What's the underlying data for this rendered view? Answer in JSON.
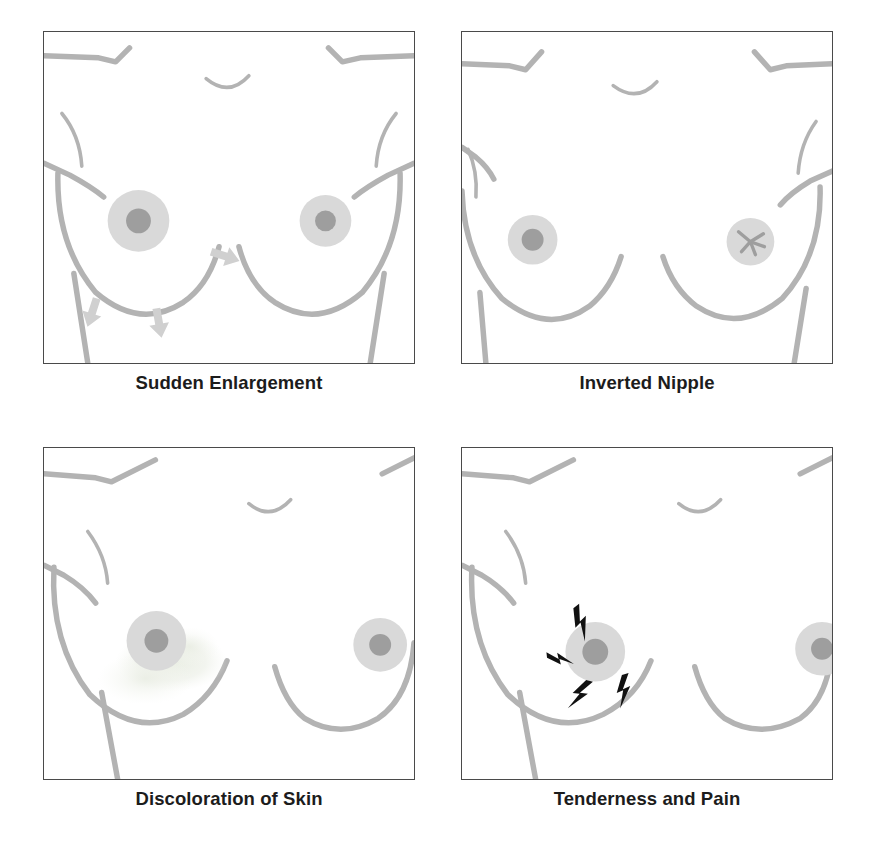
{
  "figure": {
    "layout": "2x2 grid of framed line-art panels with bold captions",
    "background_color": "#ffffff",
    "frame_border_color": "#4a4a4a",
    "body_line_color": "#b3b3b3",
    "areola_color": "#d9d9d9",
    "nipple_color": "#9e9e9e",
    "arrow_color": "#d0d0d0",
    "discoloration_color": "#ecefe6",
    "pain_bolt_color": "#111111",
    "caption_color": "#1c1c1c"
  },
  "panels": [
    {
      "id": "sudden-enlargement",
      "caption": "Sudden Enlargement",
      "marker": "arrows",
      "marker_description": "Light gray arrows pointing outward and downward from the left breast indicating swelling",
      "arrow_count": 3,
      "affected_side": "left"
    },
    {
      "id": "inverted-nipple",
      "caption": "Inverted Nipple",
      "marker": "star-pucker",
      "marker_description": "Right areola shows a puckered asterisk shape instead of a protruding nipple",
      "arrow_count": 0,
      "affected_side": "right"
    },
    {
      "id": "discoloration-of-skin",
      "caption": "Discoloration of Skin",
      "marker": "blotch",
      "marker_description": "Faint mottled discolored patch on the lower left breast below the areola",
      "arrow_count": 0,
      "affected_side": "left"
    },
    {
      "id": "tenderness-and-pain",
      "caption": "Tenderness and Pain",
      "marker": "lightning-bolts",
      "marker_description": "Four black lightning bolts radiating around the left areola indicating pain",
      "arrow_count": 0,
      "bolt_count": 4,
      "affected_side": "left"
    }
  ]
}
